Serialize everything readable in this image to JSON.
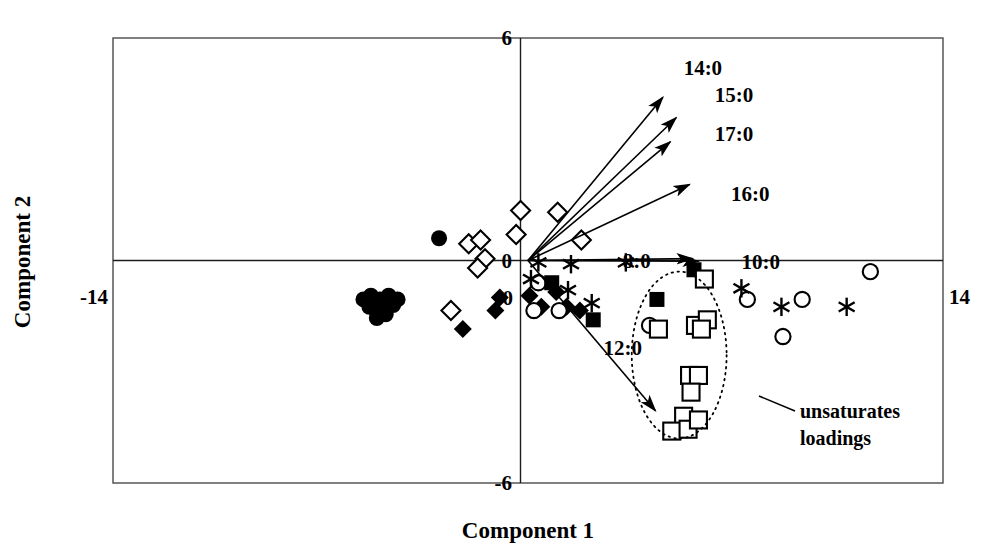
{
  "figure": {
    "kind": "pca-biplot",
    "background_color": "#ffffff",
    "ink_color": "#000000",
    "frame_color": "#4a4a4a"
  },
  "axes": {
    "xlabel": "Component 1",
    "ylabel": "Component 2",
    "x_min_label": "-14",
    "x_max_label": "14",
    "x_zero_label": "0",
    "y_max_label": "6",
    "y_min_label": "-6",
    "y_zero_label": "0"
  },
  "annotations": {
    "unsaturates_line1": "unsaturates",
    "unsaturates_line2": "loadings"
  },
  "chart_data": {
    "type": "scatter",
    "title": "",
    "xlabel": "Component 1",
    "ylabel": "Component 2",
    "xlim": [
      -14,
      14
    ],
    "ylim": [
      -6,
      6
    ],
    "grid": false,
    "legend": "none",
    "xticks": [
      -14,
      0,
      14
    ],
    "yticks": [
      -6,
      0,
      6
    ],
    "loading_vectors": [
      {
        "label": "14:0",
        "x": 4.55,
        "y": 4.4,
        "label_x": 5.25,
        "label_y": 5.2
      },
      {
        "label": "15:0",
        "x": 5.0,
        "y": 3.85,
        "label_x": 6.3,
        "label_y": 4.45
      },
      {
        "label": "17:0",
        "x": 4.8,
        "y": 3.2,
        "label_x": 6.3,
        "label_y": 3.4
      },
      {
        "label": "16:0",
        "x": 5.45,
        "y": 2.05,
        "label_x": 6.85,
        "label_y": 1.8
      },
      {
        "label": "8:0",
        "x": 5.55,
        "y": 0.05,
        "label_x": 3.2,
        "label_y": 0.0
      },
      {
        "label": "10:0",
        "x": 5.75,
        "y": -0.02,
        "label_x": 7.2,
        "label_y": -0.05
      },
      {
        "label": "12:0",
        "x": 4.3,
        "y": -4.05,
        "label_x": 2.55,
        "label_y": -2.35
      }
    ],
    "ellipse": {
      "label": "unsaturates loadings",
      "cx": 5.1,
      "cy": -2.55,
      "rx": 1.6,
      "ry": 2.25,
      "rotation": 0,
      "style": "dotted"
    },
    "series": [
      {
        "name": "filled-circle",
        "marker": "filled-circle",
        "points": [
          [
            -3.0,
            0.6
          ],
          [
            -5.3,
            -0.95
          ],
          [
            -5.0,
            -1.05
          ],
          [
            -4.7,
            -0.95
          ],
          [
            -4.95,
            -1.3
          ],
          [
            -5.35,
            -1.25
          ],
          [
            -4.55,
            -1.2
          ],
          [
            -5.1,
            -1.55
          ],
          [
            -4.8,
            -1.45
          ],
          [
            -5.55,
            -1.05
          ],
          [
            -4.4,
            -1.05
          ]
        ]
      },
      {
        "name": "open-diamond",
        "marker": "open-diamond",
        "points": [
          [
            -2.0,
            0.45
          ],
          [
            -1.6,
            0.55
          ],
          [
            -1.45,
            0.05
          ],
          [
            -1.7,
            -0.2
          ],
          [
            -0.25,
            1.35
          ],
          [
            -0.4,
            0.7
          ],
          [
            1.0,
            1.3
          ],
          [
            1.8,
            0.55
          ],
          [
            -2.6,
            -1.35
          ]
        ]
      },
      {
        "name": "filled-diamond",
        "marker": "filled-diamond",
        "points": [
          [
            -0.95,
            -1.0
          ],
          [
            -1.1,
            -1.35
          ],
          [
            -2.2,
            -1.85
          ],
          [
            0.05,
            -0.95
          ],
          [
            0.45,
            -1.25
          ],
          [
            0.95,
            -0.85
          ],
          [
            1.3,
            -1.25
          ],
          [
            1.75,
            -1.35
          ]
        ]
      },
      {
        "name": "open-circle",
        "marker": "open-circle",
        "points": [
          [
            0.35,
            -0.6
          ],
          [
            0.2,
            -1.35
          ],
          [
            1.05,
            -1.35
          ],
          [
            4.1,
            -1.75
          ],
          [
            7.4,
            -1.05
          ],
          [
            8.6,
            -2.05
          ],
          [
            11.55,
            -0.3
          ],
          [
            9.25,
            -1.05
          ]
        ]
      },
      {
        "name": "filled-square",
        "marker": "filled-square",
        "points": [
          [
            0.8,
            -0.6
          ],
          [
            2.2,
            -1.6
          ],
          [
            4.35,
            -1.05
          ],
          [
            5.6,
            -0.25
          ]
        ]
      },
      {
        "name": "open-square",
        "marker": "open-square",
        "points": [
          [
            5.95,
            -0.5
          ],
          [
            4.4,
            -1.85
          ],
          [
            5.65,
            -1.75
          ],
          [
            6.05,
            -1.6
          ],
          [
            5.85,
            -1.85
          ],
          [
            5.45,
            -3.1
          ],
          [
            5.75,
            -3.1
          ],
          [
            5.5,
            -3.55
          ],
          [
            5.25,
            -4.2
          ],
          [
            4.85,
            -4.6
          ],
          [
            5.4,
            -4.55
          ],
          [
            5.75,
            -4.3
          ]
        ]
      },
      {
        "name": "asterisk",
        "marker": "asterisk",
        "points": [
          [
            0.1,
            -0.5
          ],
          [
            0.35,
            -0.05
          ],
          [
            1.45,
            -0.1
          ],
          [
            1.35,
            -0.8
          ],
          [
            2.15,
            -1.15
          ],
          [
            3.3,
            -0.05
          ],
          [
            7.2,
            -0.75
          ],
          [
            8.55,
            -1.25
          ],
          [
            10.75,
            -1.25
          ]
        ]
      }
    ]
  }
}
